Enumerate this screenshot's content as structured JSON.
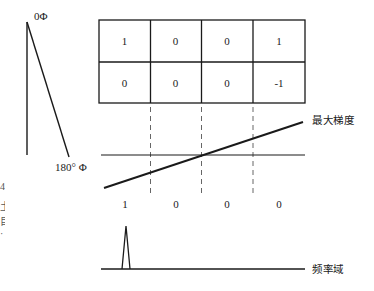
{
  "phase_diagram": {
    "top_label": "0Φ",
    "bottom_label": "180° Φ"
  },
  "grid": {
    "rows": [
      [
        "1",
        "0",
        "0",
        "1"
      ],
      [
        "0",
        "0",
        "0",
        "-1"
      ]
    ]
  },
  "gradient_panel": {
    "line_label": "最大梯度",
    "bit_labels": [
      "1",
      "0",
      "0",
      "0"
    ]
  },
  "frequency_panel": {
    "axis_label": "频率域"
  },
  "edge_fragments": [
    "4",
    "土",
    "目",
    "·"
  ],
  "colors": {
    "stroke": "#1a1a1a",
    "dashed": "#666666",
    "background": "#ffffff"
  }
}
